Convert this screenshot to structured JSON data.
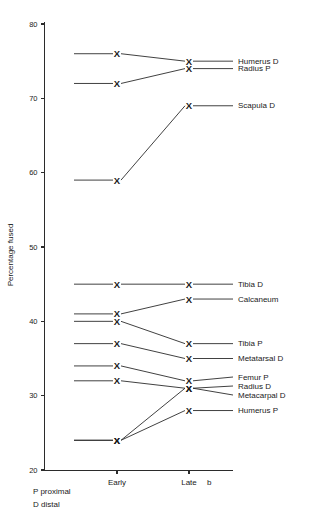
{
  "chart_data": {
    "type": "line",
    "title": "",
    "xlabel": "",
    "ylabel": "Percentage fused",
    "ylim": [
      20,
      80
    ],
    "grid": false,
    "legend_position": "right-inline-labels",
    "categories": [
      "Early",
      "Late  b"
    ],
    "x_tick_labels": [
      "Early",
      "Late",
      "b"
    ],
    "y_tick_labels": [
      "20",
      "30",
      "40",
      "50",
      "60",
      "70",
      "80"
    ],
    "y_ticks": [
      20,
      30,
      40,
      50,
      60,
      70,
      80
    ],
    "series": [
      {
        "name": "Humerus D",
        "values": [
          76,
          75
        ]
      },
      {
        "name": "Radius P",
        "values": [
          72,
          74
        ]
      },
      {
        "name": "Scapula D",
        "values": [
          59,
          69
        ]
      },
      {
        "name": "Tibia  D",
        "values": [
          45,
          45
        ]
      },
      {
        "name": "Calcaneum",
        "values": [
          41,
          43
        ]
      },
      {
        "name": "Tibia  P",
        "values": [
          40,
          37
        ]
      },
      {
        "name": "Metatarsal  D",
        "values": [
          37,
          35
        ]
      },
      {
        "name": "Femur P",
        "values": [
          34,
          32
        ]
      },
      {
        "name": "Radius D",
        "values": [
          32,
          31
        ]
      },
      {
        "name": "Metacarpal D",
        "values": [
          24,
          31
        ]
      },
      {
        "name": "Humerus  P",
        "values": [
          24,
          28
        ]
      }
    ],
    "marker": "X",
    "notes": [
      "P  proximal",
      "D  distal"
    ]
  },
  "colors": {
    "axis": "#2b2b2b",
    "line": "#2b2b2b",
    "text": "#1a1a1a",
    "background": "#ffffff"
  }
}
